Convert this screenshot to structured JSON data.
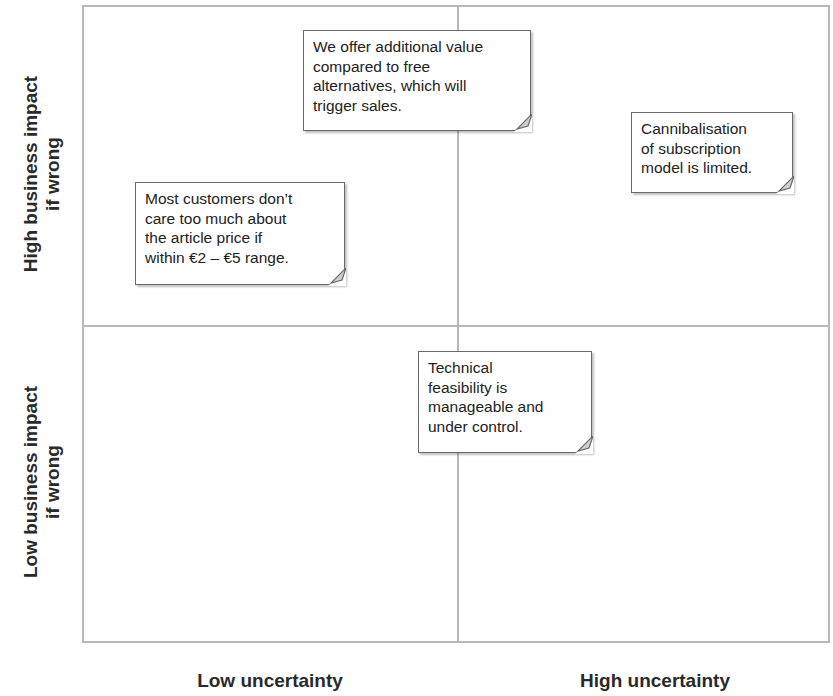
{
  "axes": {
    "y_top": "High business impact\nif wrong",
    "y_bottom": "Low business impact\nif wrong",
    "x_left": "Low uncertainty",
    "x_right": "High uncertainty"
  },
  "notes": [
    {
      "id": "additional-value",
      "quadrant": "top-center",
      "text": "We offer additional value\ncompared to free\nalternatives, which will\ntrigger sales."
    },
    {
      "id": "cannibalisation",
      "quadrant": "top-right",
      "text": "Cannibalisation\nof subscription\nmodel is limited."
    },
    {
      "id": "article-price",
      "quadrant": "top-left",
      "text": "Most customers don’t\ncare too much about\nthe article price if\nwithin €2 – €5 range."
    },
    {
      "id": "technical-feasibility",
      "quadrant": "bottom-center",
      "text": "Technical\nfeasibility is\nmanageable and\nunder control."
    }
  ],
  "colors": {
    "grid": "#b8b8b8",
    "note_border": "#6a6a6a",
    "text": "#222222"
  }
}
